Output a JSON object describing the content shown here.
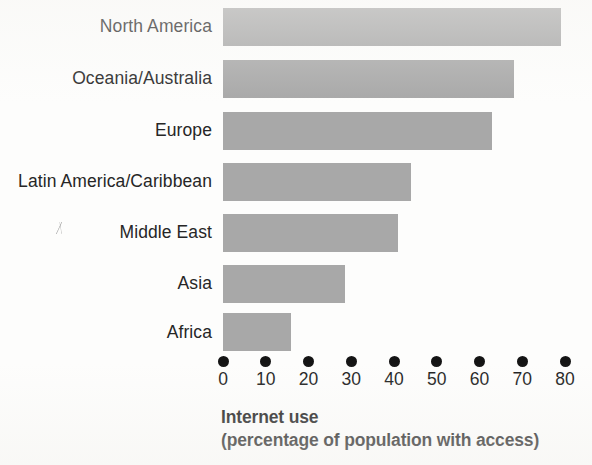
{
  "chart_data": {
    "type": "bar",
    "orientation": "horizontal",
    "title": "Internet use",
    "subtitle": "(percentage of population with access)",
    "xlabel": "Internet use (percentage of population with access)",
    "ylabel": "",
    "xlim": [
      0,
      80
    ],
    "grid": false,
    "legend": null,
    "bar_color": "#a8a8a8",
    "categories": [
      "North America",
      "Oceania/Australia",
      "Europe",
      "Latin America/Caribbean",
      "Middle East",
      "Asia",
      "Africa"
    ],
    "values": [
      79,
      68,
      63,
      44,
      41,
      28.5,
      16
    ],
    "xticks": [
      0,
      10,
      20,
      30,
      40,
      50,
      60,
      70,
      80
    ],
    "xticklabels": [
      "0",
      "10",
      "20",
      "30",
      "40",
      "50",
      "60",
      "70",
      "80"
    ]
  }
}
